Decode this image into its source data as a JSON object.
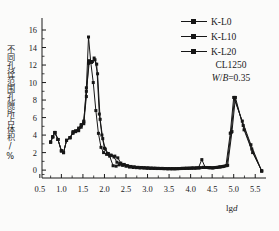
{
  "chart_data": {
    "type": "line",
    "title": "",
    "xlabel": "lgd",
    "ylabel": "不同孔径范围孔隙所占体积/%",
    "xlim": [
      0.55,
      5.75
    ],
    "ylim": [
      -0.9,
      16.8
    ],
    "xticks": [
      "0.5",
      "1.0",
      "1.5",
      "2.0",
      "2.5",
      "3.0",
      "3.5",
      "4.0",
      "4.5",
      "5.0",
      "5.5"
    ],
    "xtick_values": [
      0.5,
      1.0,
      1.5,
      2.0,
      2.5,
      3.0,
      3.5,
      4.0,
      4.5,
      5.0,
      5.5
    ],
    "yticks": [
      "0",
      "2",
      "4",
      "6",
      "8",
      "10",
      "12",
      "14",
      "16"
    ],
    "ytick_values": [
      0,
      2,
      4,
      6,
      8,
      10,
      12,
      14,
      16
    ],
    "grid": false,
    "legend_position": "top-right",
    "marker": "square",
    "line_color": "#161616",
    "annotations": [
      "CL1250",
      "W/B=0.35"
    ],
    "series": [
      {
        "name": "K-L0",
        "x": [
          0.75,
          0.8,
          0.85,
          0.92,
          1.0,
          1.05,
          1.12,
          1.2,
          1.27,
          1.33,
          1.4,
          1.46,
          1.52,
          1.58,
          1.63,
          1.68,
          1.74,
          1.8,
          1.86,
          1.92,
          1.98,
          2.05,
          2.12,
          2.2,
          2.27,
          2.34,
          2.42,
          2.5,
          2.58,
          2.66,
          2.74,
          2.82,
          2.9,
          2.98,
          3.06,
          3.14,
          3.22,
          3.3,
          3.38,
          3.46,
          3.54,
          3.62,
          3.7,
          3.78,
          3.86,
          3.94,
          4.02,
          4.1,
          4.18,
          4.26,
          4.34,
          4.42,
          4.5,
          4.58,
          4.66,
          4.74,
          4.82,
          4.92,
          5.0,
          5.2,
          5.4,
          5.65
        ],
        "y": [
          3.2,
          3.8,
          4.3,
          3.5,
          2.2,
          2.0,
          3.4,
          3.7,
          4.3,
          4.4,
          4.6,
          5.1,
          5.5,
          9.4,
          15.2,
          12.4,
          10.0,
          6.8,
          4.2,
          2.6,
          2.0,
          1.8,
          1.6,
          0.5,
          0.45,
          0.6,
          0.55,
          0.45,
          0.35,
          0.3,
          0.28,
          0.25,
          0.25,
          0.22,
          0.2,
          0.2,
          0.18,
          0.18,
          0.16,
          0.15,
          0.15,
          0.15,
          0.16,
          0.18,
          0.2,
          0.2,
          0.22,
          0.22,
          0.25,
          1.2,
          0.3,
          0.28,
          0.25,
          0.3,
          0.35,
          0.4,
          0.5,
          4.2,
          8.3,
          5.6,
          2.9,
          -0.1
        ]
      },
      {
        "name": "K-L10",
        "x": [
          0.75,
          0.8,
          0.85,
          0.92,
          1.0,
          1.05,
          1.12,
          1.2,
          1.27,
          1.33,
          1.4,
          1.46,
          1.52,
          1.58,
          1.63,
          1.7,
          1.76,
          1.82,
          1.88,
          1.94,
          2.0,
          2.07,
          2.14,
          2.22,
          2.29,
          2.36,
          2.44,
          2.52,
          2.6,
          2.68,
          2.76,
          2.84,
          2.92,
          3.0,
          3.08,
          3.16,
          3.24,
          3.32,
          3.4,
          3.48,
          3.56,
          3.64,
          3.72,
          3.8,
          3.88,
          3.96,
          4.04,
          4.12,
          4.2,
          4.28,
          4.36,
          4.44,
          4.52,
          4.6,
          4.68,
          4.76,
          4.84,
          4.94,
          5.02,
          5.22,
          5.42,
          5.65
        ],
        "y": [
          3.2,
          3.8,
          4.3,
          3.5,
          2.2,
          2.0,
          3.4,
          3.7,
          4.2,
          4.4,
          4.5,
          4.9,
          5.3,
          8.4,
          12.2,
          12.3,
          12.8,
          12.1,
          6.4,
          4.0,
          2.5,
          1.9,
          1.7,
          1.5,
          0.9,
          0.75,
          0.6,
          0.5,
          0.4,
          0.35,
          0.3,
          0.28,
          0.26,
          0.24,
          0.22,
          0.2,
          0.2,
          0.18,
          0.18,
          0.16,
          0.16,
          0.16,
          0.18,
          0.2,
          0.2,
          0.22,
          0.24,
          0.24,
          0.26,
          0.3,
          0.3,
          0.28,
          0.26,
          0.3,
          0.36,
          0.42,
          0.52,
          4.3,
          8.3,
          5.1,
          2.4,
          -0.1
        ]
      },
      {
        "name": "K-L20",
        "x": [
          0.75,
          0.8,
          0.85,
          0.92,
          1.0,
          1.05,
          1.12,
          1.2,
          1.27,
          1.33,
          1.4,
          1.46,
          1.52,
          1.58,
          1.65,
          1.72,
          1.78,
          1.84,
          1.9,
          1.96,
          2.02,
          2.09,
          2.16,
          2.24,
          2.31,
          2.38,
          2.46,
          2.54,
          2.62,
          2.7,
          2.78,
          2.86,
          2.94,
          3.02,
          3.1,
          3.18,
          3.26,
          3.34,
          3.42,
          3.5,
          3.58,
          3.66,
          3.74,
          3.82,
          3.9,
          3.98,
          4.06,
          4.14,
          4.22,
          4.3,
          4.38,
          4.46,
          4.54,
          4.62,
          4.7,
          4.78,
          4.86,
          4.96,
          5.04,
          5.24,
          5.44,
          5.65
        ],
        "y": [
          3.2,
          3.8,
          4.3,
          3.5,
          2.2,
          2.0,
          3.4,
          3.7,
          4.4,
          4.5,
          4.8,
          5.2,
          5.6,
          9.0,
          12.5,
          12.4,
          12.6,
          11.0,
          5.8,
          3.6,
          2.4,
          1.9,
          1.7,
          1.6,
          1.4,
          0.8,
          0.65,
          0.5,
          0.42,
          0.36,
          0.32,
          0.3,
          0.27,
          0.25,
          0.23,
          0.22,
          0.2,
          0.2,
          0.18,
          0.18,
          0.17,
          0.17,
          0.18,
          0.2,
          0.22,
          0.22,
          0.24,
          0.26,
          0.28,
          0.32,
          0.3,
          0.28,
          0.28,
          0.32,
          0.38,
          0.45,
          0.55,
          4.4,
          8.3,
          4.6,
          2.0,
          -0.1
        ]
      }
    ]
  },
  "legend": {
    "items": [
      {
        "label": "K-L0"
      },
      {
        "label": "K-L10"
      },
      {
        "label": "K-L20"
      }
    ]
  },
  "annotations": {
    "sample": "CL1250",
    "ratio_prefix": "W",
    "ratio_sep": "/",
    "ratio_denom": "B",
    "ratio_value": "=0.35"
  },
  "axes": {
    "x_label_main": "lg",
    "x_label_italic": "d",
    "y_label": "不同孔径范围孔隙所占体积/%"
  }
}
